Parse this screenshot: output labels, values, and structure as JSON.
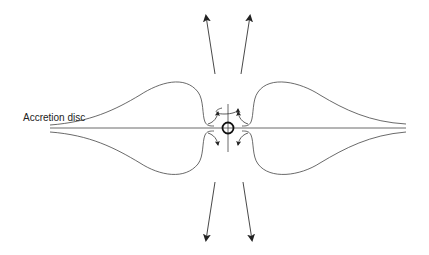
{
  "diagram": {
    "labels": {
      "accretion_disc": "Accretion disc"
    },
    "colors": {
      "line": "#333333",
      "background": "#ffffff"
    }
  }
}
